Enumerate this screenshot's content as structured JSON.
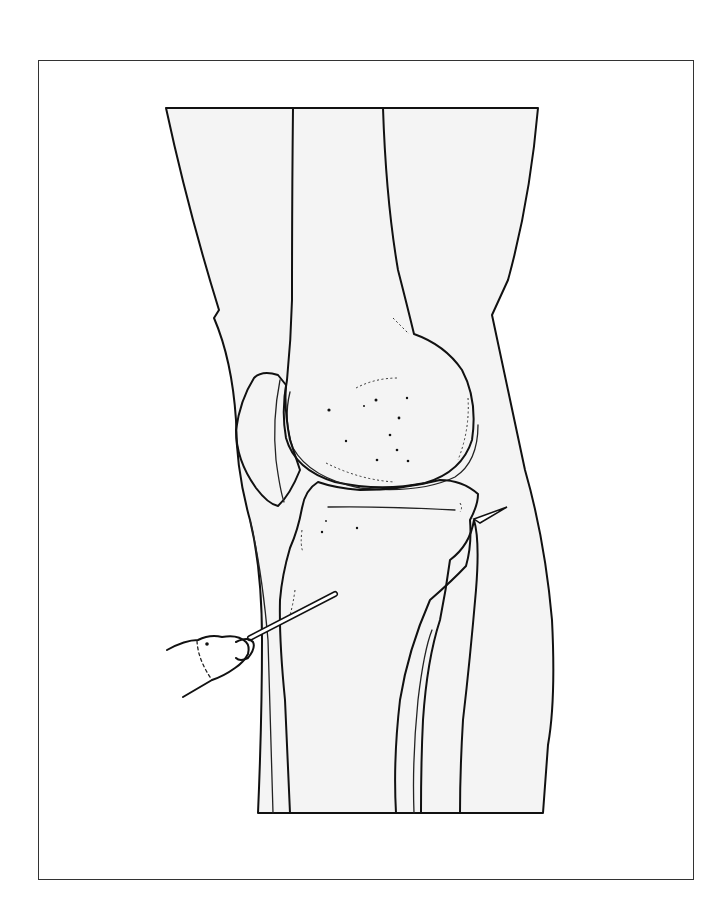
{
  "figure": {
    "colors": {
      "background": "#ffffff",
      "soft_tissue_fill": "#f4f4f4",
      "bone_fill": "#ffffff",
      "line": "#111111",
      "frame": "#333333"
    },
    "frame": {
      "x": 38,
      "y": 60,
      "width": 656,
      "height": 820
    },
    "elements": [
      {
        "name": "leg-soft-tissue",
        "icon": "leg-outline"
      },
      {
        "name": "femur",
        "icon": "bone-femur"
      },
      {
        "name": "patella",
        "icon": "bone-patella"
      },
      {
        "name": "tibia",
        "icon": "bone-tibia"
      },
      {
        "name": "fibula",
        "icon": "bone-fibula"
      },
      {
        "name": "drill",
        "icon": "hand-drill"
      },
      {
        "name": "drill-pin",
        "icon": "steinmann-pin"
      },
      {
        "name": "pin-exit-tip",
        "icon": "pin-tip"
      }
    ]
  }
}
